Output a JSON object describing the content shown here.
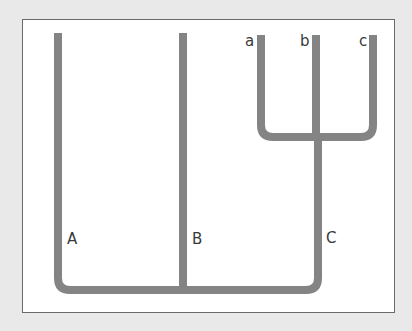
{
  "diagram": {
    "type": "phylogenetic-tree",
    "colors": {
      "background": "#e9e9e9",
      "panel": "#ffffff",
      "border": "#6a6a6a",
      "branch": "#848484",
      "label": "#3a3a3a"
    },
    "labels": {
      "A": "A",
      "B": "B",
      "C": "C",
      "a": "a",
      "b": "b",
      "c": "c"
    },
    "structure": {
      "root_children": [
        "A",
        "B",
        "C"
      ],
      "C_children": [
        "a",
        "b",
        "c"
      ]
    }
  }
}
